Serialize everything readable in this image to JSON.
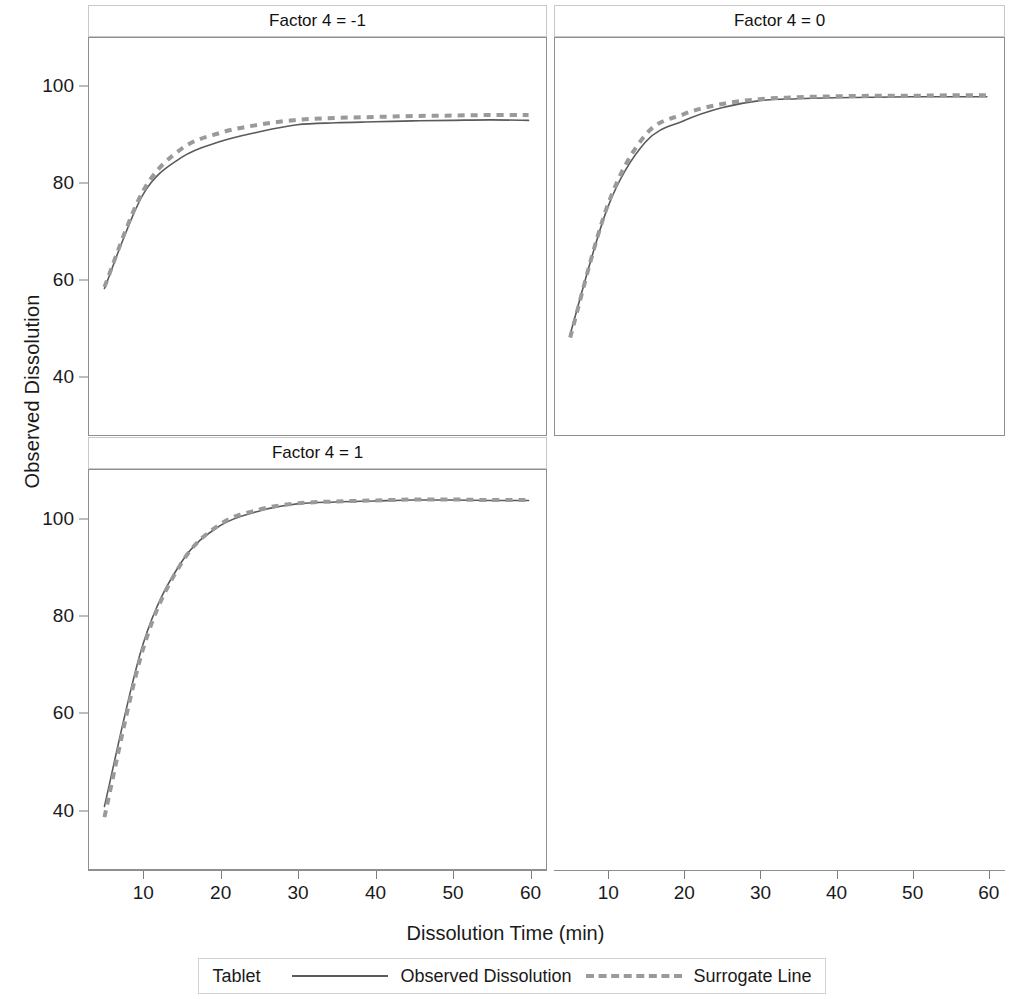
{
  "figure": {
    "xlabel": "Dissolution Time (min)",
    "ylabel": "Observed Dissolution"
  },
  "legend": {
    "title": "Tablet",
    "items": [
      {
        "label": "Observed Dissolution",
        "style": "solid",
        "color": "#5a5a5a"
      },
      {
        "label": "Surrogate Line",
        "style": "dashed",
        "color": "#9a9a9a"
      }
    ]
  },
  "panels": [
    {
      "title": "Factor 4 = -1"
    },
    {
      "title": "Factor 4 = 0"
    },
    {
      "title": "Factor 4 = 1"
    },
    {
      "title": ""
    }
  ],
  "axes": {
    "y_ticks": [
      40,
      60,
      80,
      100
    ],
    "y_tick_labels": [
      "40",
      "60",
      "80",
      "100"
    ],
    "x_ticks": [
      10,
      20,
      30,
      40,
      50,
      60
    ],
    "x_tick_labels": [
      "10",
      "20",
      "30",
      "40",
      "50",
      "60"
    ],
    "xlim": [
      3,
      62
    ],
    "ylim": [
      28,
      110
    ],
    "grid": false
  },
  "chart_data": {
    "type": "line",
    "title": "",
    "xlabel": "Dissolution Time (min)",
    "ylabel": "Observed Dissolution",
    "xlim": [
      3,
      62
    ],
    "ylim": [
      28,
      110
    ],
    "grid": false,
    "legend_position": "bottom",
    "legend_title": "Tablet",
    "panels": [
      {
        "title": "Factor 4 = -1",
        "x": [
          5,
          10,
          15,
          20,
          25,
          30,
          35,
          40,
          45,
          50,
          55,
          60
        ],
        "series": [
          {
            "name": "Observed Dissolution",
            "style": "solid",
            "values": [
              58.0,
              77.5,
              85.2,
              88.5,
              90.5,
              92.0,
              92.4,
              92.6,
              92.8,
              92.9,
              93.0,
              92.9
            ]
          },
          {
            "name": "Surrogate Line",
            "style": "dashed",
            "values": [
              58.3,
              78.2,
              87.0,
              90.3,
              92.0,
              93.0,
              93.4,
              93.6,
              93.8,
              93.9,
              94.0,
              94.0
            ]
          }
        ]
      },
      {
        "title": "Factor 4 = 0",
        "x": [
          5,
          10,
          15,
          20,
          25,
          30,
          35,
          40,
          45,
          50,
          55,
          60
        ],
        "series": [
          {
            "name": "Observed Dissolution",
            "style": "solid",
            "values": [
              48.5,
              75.0,
              88.5,
              92.8,
              95.5,
              97.0,
              97.4,
              97.6,
              97.7,
              97.8,
              97.8,
              97.8
            ]
          },
          {
            "name": "Surrogate Line",
            "style": "dashed",
            "values": [
              47.8,
              75.5,
              90.0,
              94.2,
              96.3,
              97.3,
              97.7,
              97.9,
              98.0,
              98.0,
              98.1,
              98.1
            ]
          }
        ]
      },
      {
        "title": "Factor 4 = 1",
        "x": [
          5,
          10,
          15,
          20,
          25,
          30,
          35,
          40,
          45,
          50,
          55,
          60
        ],
        "series": [
          {
            "name": "Observed Dissolution",
            "style": "solid",
            "values": [
              40.5,
              74.0,
              91.0,
              98.5,
              101.5,
              103.0,
              103.4,
              103.6,
              103.8,
              103.8,
              103.7,
              103.7
            ]
          },
          {
            "name": "Surrogate Line",
            "style": "dashed",
            "values": [
              38.3,
              73.0,
              90.8,
              98.8,
              101.8,
              103.1,
              103.5,
              103.7,
              103.9,
              103.9,
              103.8,
              103.8
            ]
          }
        ]
      }
    ]
  }
}
